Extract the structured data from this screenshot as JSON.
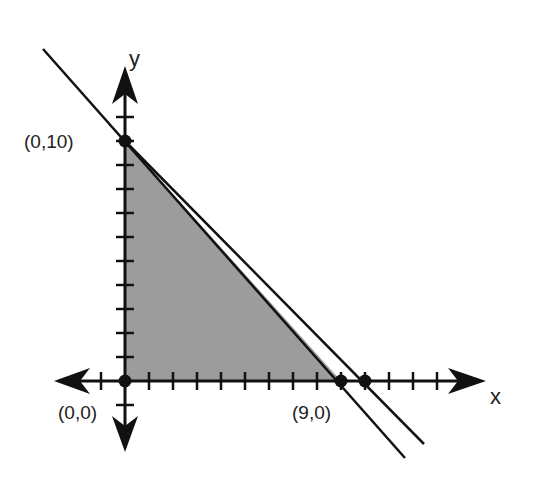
{
  "diagram": {
    "type": "feasible-region-graph",
    "axes": {
      "x_label": "x",
      "y_label": "y"
    },
    "points": [
      {
        "label": "(0,10)",
        "x": 0,
        "y": 10
      },
      {
        "label": "(0,0)",
        "x": 0,
        "y": 0
      },
      {
        "label": "(9,0)",
        "x": 9,
        "y": 0
      },
      {
        "label": "",
        "x": 10,
        "y": 0
      }
    ],
    "lines": [
      {
        "name": "line-through-0-10-and-9-0",
        "from": [
          0,
          10
        ],
        "to": [
          9,
          0
        ]
      },
      {
        "name": "line-through-0-10-and-10-0",
        "from": [
          0,
          10
        ],
        "to": [
          10,
          0
        ]
      }
    ],
    "shaded_region": {
      "vertices": [
        [
          0,
          0
        ],
        [
          0,
          10
        ],
        [
          9,
          0
        ]
      ],
      "color": "#9a9a9a"
    },
    "x_ticks": [
      -1,
      1,
      2,
      3,
      4,
      5,
      6,
      7,
      8,
      9,
      10,
      11,
      12,
      13
    ],
    "y_ticks": [
      -1,
      1,
      2,
      3,
      4,
      5,
      6,
      7,
      8,
      9,
      10,
      11
    ]
  },
  "labels": {
    "p0_10": "(0,10)",
    "p0_0": "(0,0)",
    "p9_0": "(9,0)",
    "x": "x",
    "y": "y"
  }
}
